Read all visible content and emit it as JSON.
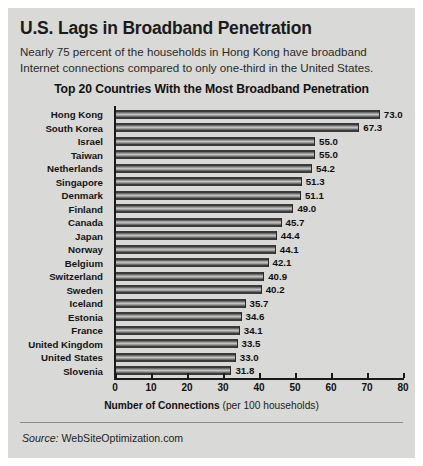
{
  "headline": "U.S. Lags in Broadband Penetration",
  "deck": "Nearly 75 percent of the households in Hong Kong have broadband Internet connections compared to only one-third in the United States.",
  "source_label": "Source:",
  "source_value": "WebSiteOptimization.com",
  "axis_title_bold": "Number of Connections",
  "axis_title_rest": " (per 100 households)",
  "colors": {
    "card_bg": "#d9d9d7",
    "page_bg": "#ffffff",
    "bar_dark": "#3a3a3a",
    "bar_light": "#c2c2c2",
    "text": "#111111"
  },
  "chart_data": {
    "type": "bar",
    "orientation": "horizontal",
    "title": "Top 20 Countries With the Most Broadband Penetration",
    "xlabel": "Number of Connections (per 100 households)",
    "ylabel": "",
    "xlim": [
      0,
      80
    ],
    "xticks": [
      0,
      10,
      20,
      30,
      40,
      50,
      60,
      70,
      80
    ],
    "grid": false,
    "legend": false,
    "categories": [
      "Hong Kong",
      "South Korea",
      "Israel",
      "Taiwan",
      "Netherlands",
      "Singapore",
      "Denmark",
      "Finland",
      "Canada",
      "Japan",
      "Norway",
      "Belgium",
      "Switzerland",
      "Sweden",
      "Iceland",
      "Estonia",
      "France",
      "United Kingdom",
      "United States",
      "Slovenia"
    ],
    "values": [
      73.0,
      67.3,
      55.0,
      55.0,
      54.2,
      51.3,
      51.1,
      49.0,
      45.7,
      44.4,
      44.1,
      42.1,
      40.9,
      40.2,
      35.7,
      34.6,
      34.1,
      33.5,
      33.0,
      31.8
    ],
    "value_labels": [
      "73.0",
      "67.3",
      "55.0",
      "55.0",
      "54.2",
      "51.3",
      "51.1",
      "49.0",
      "45.7",
      "44.4",
      "44.1",
      "42.1",
      "40.9",
      "40.2",
      "35.7",
      "34.6",
      "34.1",
      "33.5",
      "33.0",
      "31.8"
    ]
  }
}
